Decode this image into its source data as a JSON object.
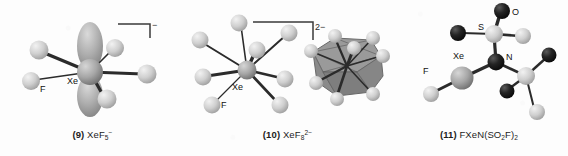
{
  "figure": {
    "background_color": "#fdfdfd",
    "sphere_light_color": "#c9c9c9",
    "sphere_mid_color": "#9a9a9a",
    "sphere_dark_color": "#1f1f1f",
    "bond_color": "#2b2b2b",
    "polyhedron_color": "#8c8c8c"
  },
  "structures": [
    {
      "number": "(9)",
      "formula_text": "XeF5-",
      "formula_core": "XeF",
      "formula_sub": "5",
      "formula_sup": "−",
      "charge_bracket_label": "−",
      "has_charge_bracket": true,
      "has_lone_pair_lobe": true,
      "atom_labels": [
        {
          "text": "Xe",
          "x": 72,
          "y": 82
        },
        {
          "text": "F",
          "x": 44,
          "y": 90
        }
      ],
      "geometry": "pentagonal planar with axial lone pair"
    },
    {
      "number": "(10)",
      "formula_text": "XeF8 2-",
      "formula_core": "XeF",
      "formula_sub": "8",
      "formula_sup": "2−",
      "charge_bracket_label": "2−",
      "has_charge_bracket": true,
      "has_lone_pair_lobe": false,
      "atom_labels": [
        {
          "text": "Xe",
          "x": 232,
          "y": 88
        },
        {
          "text": "F",
          "x": 221,
          "y": 106
        }
      ],
      "geometry": "square antiprism, shown also as polyhedron"
    },
    {
      "number": "(11)",
      "formula_text": "FXeN(SO2F)2",
      "formula_core": "FXeN(SO",
      "formula_sub": "2",
      "formula_tail": "F)",
      "formula_sub2": "2",
      "has_charge_bracket": false,
      "has_lone_pair_lobe": false,
      "atom_labels": [
        {
          "text": "S",
          "x": 478,
          "y": 33
        },
        {
          "text": "O",
          "x": 512,
          "y": 17
        },
        {
          "text": "Xe",
          "x": 455,
          "y": 62
        },
        {
          "text": "N",
          "x": 490,
          "y": 63
        },
        {
          "text": "F",
          "x": 428,
          "y": 76
        }
      ],
      "geometry": "FXeN(SO2F)2 molecule"
    }
  ]
}
